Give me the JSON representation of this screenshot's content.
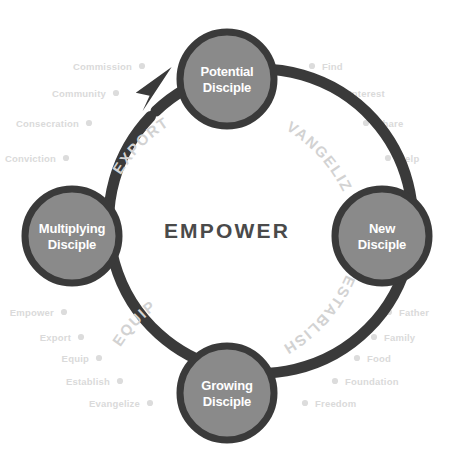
{
  "diagram": {
    "center_label": "EMPOWER",
    "colors": {
      "node_fill": "#8a8a8a",
      "ring": "#3a3a3a",
      "node_text": "#ffffff",
      "center_text": "#4a4a4a",
      "arc_label": "#d2d2d2",
      "outer_label": "#dadada",
      "outer_dot": "#dcdcdc",
      "background": "#ffffff"
    },
    "nodes": [
      {
        "id": "potential",
        "line1": "Potential",
        "line2": "Disciple",
        "position": "top"
      },
      {
        "id": "new",
        "line1": "New",
        "line2": "Disciple",
        "position": "right"
      },
      {
        "id": "growing",
        "line1": "Growing",
        "line2": "Disciple",
        "position": "bottom"
      },
      {
        "id": "multiplying",
        "line1": "Multiplying",
        "line2": "Disciple",
        "position": "left"
      }
    ],
    "arc_labels": [
      {
        "id": "evangelize",
        "text": "EVANGELIZE",
        "quadrant": "upper-right"
      },
      {
        "id": "establish",
        "text": "ESTABLISH",
        "quadrant": "lower-right"
      },
      {
        "id": "equip",
        "text": "EQUIP",
        "quadrant": "lower-left"
      },
      {
        "id": "export",
        "text": "EXPORT",
        "quadrant": "upper-left"
      }
    ],
    "outer_groups": [
      {
        "id": "evangelize-steps",
        "side": "right",
        "quadrant": "upper-right",
        "items": [
          "Find",
          "Interest",
          "Share",
          "Help"
        ]
      },
      {
        "id": "establish-steps",
        "side": "right",
        "quadrant": "lower-right",
        "items": [
          "Father",
          "Family",
          "Food",
          "Foundation",
          "Freedom"
        ]
      },
      {
        "id": "equip-steps",
        "side": "left",
        "quadrant": "lower-left",
        "items": [
          "Empower",
          "Export",
          "Equip",
          "Establish",
          "Evangelize"
        ]
      },
      {
        "id": "export-steps",
        "side": "left",
        "quadrant": "upper-left",
        "items": [
          "Commission",
          "Community",
          "Consecration",
          "Conviction"
        ]
      }
    ],
    "arrow": {
      "id": "cycle-arrow",
      "direction": "clockwise",
      "points_to": "Potential Disciple"
    }
  }
}
